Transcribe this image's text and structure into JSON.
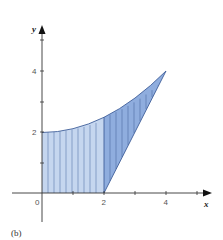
{
  "figure": {
    "caption": "(b)",
    "x_axis_label": "x",
    "y_axis_label": "y",
    "x_tick_labels": [
      "0",
      "2",
      "4"
    ],
    "y_tick_labels": [
      "2",
      "4"
    ],
    "colors": {
      "region_light": "#c5d6ef",
      "region_dark": "#8fadde",
      "outline": "#3f5f9a",
      "hatch": "#5a78ad",
      "axis": "#333333"
    }
  },
  "diagram": {
    "type": "region-between-curves",
    "curve": "y = 2 + x^2/8 (from (0,2) to (4,4))",
    "line": "y = 2x - 4 (from (2,0) to (4,4))",
    "regions": [
      {
        "name": "left-region",
        "x_range": [
          0,
          2
        ],
        "bounded_by": [
          "y-axis",
          "x-axis",
          "curve"
        ]
      },
      {
        "name": "right-region",
        "x_range": [
          2,
          4
        ],
        "bounded_by": [
          "line",
          "curve"
        ]
      }
    ],
    "x_ticks": [
      0,
      1,
      2,
      3,
      4,
      5
    ],
    "y_ticks": [
      1,
      2,
      3,
      4,
      5
    ]
  }
}
